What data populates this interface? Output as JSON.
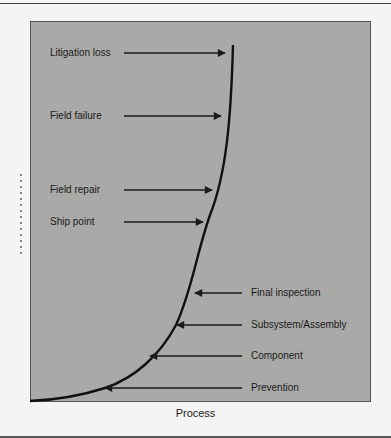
{
  "diagram": {
    "type": "cost-escalation-curve",
    "x_axis_label": "Process",
    "curve_color": "#111111",
    "panel_color": "#a9a9a7",
    "labels_left": [
      {
        "text": "Litigation loss",
        "arrow_direction": "right"
      },
      {
        "text": "Field failure",
        "arrow_direction": "right"
      },
      {
        "text": "Field repair",
        "arrow_direction": "right"
      },
      {
        "text": "Ship point",
        "arrow_direction": "right"
      }
    ],
    "labels_right": [
      {
        "text": "Final inspection",
        "arrow_direction": "left"
      },
      {
        "text": "Subsystem/Assembly",
        "arrow_direction": "left"
      },
      {
        "text": "Component",
        "arrow_direction": "left"
      },
      {
        "text": "Prevention",
        "arrow_direction": "left"
      }
    ]
  }
}
